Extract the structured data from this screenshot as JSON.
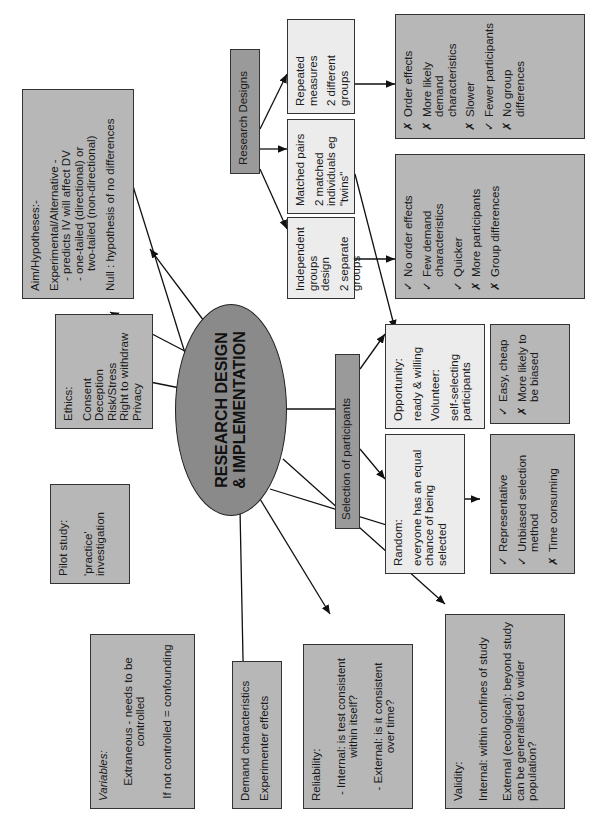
{
  "center": {
    "line1": "RESEARCH DESIGN",
    "line2": "& IMPLEMENTATION"
  },
  "research_designs": {
    "title": "Research Designs",
    "repeated": {
      "title": "Repeated measures",
      "desc": "2 different groups"
    },
    "matched": {
      "title": "Matched pairs",
      "desc": "2 matched individuals eg \"twins\""
    },
    "independent": {
      "title": "Independent groups design",
      "desc": "2 separate groups"
    },
    "repeated_eval": [
      {
        "mark": "✗",
        "text": "Order effects"
      },
      {
        "mark": "✗",
        "text": "More likely demand characteristics"
      },
      {
        "mark": "✗",
        "text": "Slower"
      },
      {
        "mark": "✓",
        "text": "Fewer participants"
      },
      {
        "mark": "✗",
        "text": "No group differences"
      }
    ],
    "independent_eval": [
      {
        "mark": "✓",
        "text": "No order effects"
      },
      {
        "mark": "✓",
        "text": "Few demand characteristics"
      },
      {
        "mark": "✓",
        "text": "Quicker"
      },
      {
        "mark": "✗",
        "text": "More participants"
      },
      {
        "mark": "✗",
        "text": "Group differences"
      }
    ]
  },
  "aim": {
    "title": "Aim/Hypotheses:-",
    "experimental": "Experimental/Alternative -",
    "l1": "- predicts IV will affect DV",
    "l2": "- one-tailed (directional) or",
    "l3": "two-tailed (non-directional)",
    "null": "Null : hypothesis of no differences"
  },
  "ethics": {
    "title": "Ethics:",
    "items": [
      "Consent",
      "Deception",
      "Risk/Stress",
      "Right to withdraw",
      "Privacy"
    ]
  },
  "pilot": {
    "title": "Pilot study:",
    "desc": "'practice' investigation"
  },
  "selection": {
    "title": "Selection of participants",
    "opportunity_label": "Opportunity:",
    "opportunity_desc": "ready & willing",
    "volunteer_label": "Volunteer:",
    "volunteer_desc": "self-selecting participants",
    "random_label": "Random:",
    "random_desc": "everyone has an equal chance of being selected",
    "opp_eval": [
      {
        "mark": "✓",
        "text": "Easy, cheap"
      },
      {
        "mark": "✗",
        "text": "More likely to be biased"
      }
    ],
    "random_eval": [
      {
        "mark": "✓",
        "text": "Representative"
      },
      {
        "mark": "✓",
        "text": "Unbiased selection method"
      },
      {
        "mark": "✗",
        "text": "Time consuming"
      }
    ]
  },
  "variables": {
    "title": "Variables:",
    "extraneous": "Extraneous - needs to be controlled",
    "confounding": "If not controlled = confounding"
  },
  "demand": {
    "l1": "Demand characteristics",
    "l2": "Experimenter effects"
  },
  "reliability": {
    "title": "Reliability:",
    "internal": "- Internal: is test consistent within itself?",
    "external": "- External: is it consistent over time?"
  },
  "validity": {
    "title": "Validity:",
    "internal": "Internal: within confines of study",
    "external": "External (ecological): beyond study can be generalised to wider population?"
  }
}
